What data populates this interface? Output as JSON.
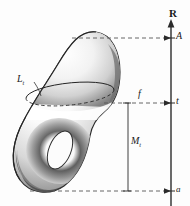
{
  "figure": {
    "background_color": "#fdfdfd",
    "ink_color": "#1a1a1a",
    "labels": {
      "axis_name": "R",
      "top_critical_value": "A",
      "level_value": "t",
      "bottom_critical_value": "a",
      "function_name": "f",
      "sublevel_set": "M",
      "sublevel_set_sub": "t",
      "level_set": "L",
      "level_set_sub": "t"
    },
    "axis": {
      "x": 171,
      "top_y": 22,
      "bottom_y": 206,
      "arrow": "up",
      "ticks": [
        {
          "name": "A",
          "y": 38
        },
        {
          "name": "t",
          "y": 103
        },
        {
          "name": "a",
          "y": 191
        }
      ]
    },
    "guides": [
      {
        "name": "top-dashed-guide",
        "y": 38,
        "x1": 72,
        "x2": 171
      },
      {
        "name": "level-dashed-guide",
        "y": 103,
        "x1": 104,
        "x2": 171
      },
      {
        "name": "bottom-dashed-guide",
        "y": 191,
        "x1": 30,
        "x2": 171
      }
    ],
    "bracket": {
      "name": "sublevel-extent-bracket",
      "x": 128,
      "top_y": 103,
      "bottom_y": 191
    },
    "surface": {
      "name": "torus-surface",
      "level_ellipse": {
        "cx": 70,
        "cy": 101,
        "rx": 44,
        "ry": 11,
        "rotation": -6
      },
      "hole": {
        "cx": 60,
        "cy": 150,
        "rx": 11,
        "ry": 20,
        "rotation": 22
      }
    }
  }
}
